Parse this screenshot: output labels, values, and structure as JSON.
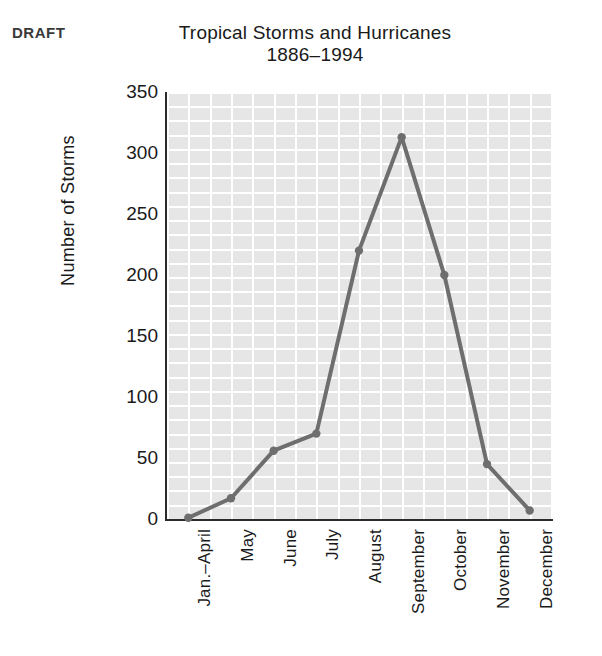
{
  "draft_label": "DRAFT",
  "chart_data": {
    "type": "line",
    "title": "Tropical Storms and Hurricanes",
    "subtitle": "1886–1994",
    "xlabel": "",
    "ylabel": "Number of Storms",
    "categories": [
      "Jan.–April",
      "May",
      "June",
      "July",
      "August",
      "September",
      "October",
      "November",
      "December"
    ],
    "values": [
      1,
      17,
      56,
      70,
      220,
      313,
      200,
      45,
      7
    ],
    "series": [
      {
        "name": "Number of Storms",
        "values": [
          1,
          17,
          56,
          70,
          220,
          313,
          200,
          45,
          7
        ]
      }
    ],
    "ylim": [
      0,
      350
    ],
    "yticks": [
      0,
      50,
      100,
      150,
      200,
      250,
      300,
      350
    ],
    "ytick_labels": [
      "0",
      "50",
      "100",
      "150",
      "200",
      "250",
      "300",
      "350"
    ],
    "grid": true,
    "legend": "none",
    "line_color": "#6e6e6e",
    "marker_color": "#6e6e6e",
    "plot_background": "#e6e6e6",
    "grid_color": "#ffffff",
    "axis_color": "#2b2b2b"
  }
}
